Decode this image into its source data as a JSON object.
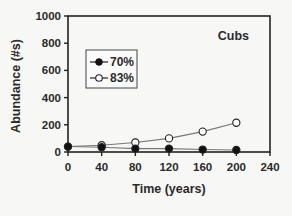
{
  "chart_data": {
    "type": "line",
    "title": "",
    "annotation": "Cubs",
    "xlabel": "Time (years)",
    "ylabel": "Abundance (#s)",
    "xlim": [
      0,
      240
    ],
    "ylim": [
      0,
      1000
    ],
    "xticks": [
      0,
      40,
      80,
      120,
      160,
      200,
      240
    ],
    "yticks": [
      0,
      200,
      400,
      600,
      800,
      1000
    ],
    "grid": false,
    "legend_position": "upper-left inside",
    "x": [
      0,
      40,
      80,
      120,
      160,
      200
    ],
    "series": [
      {
        "name": "70%",
        "marker": "filled-circle",
        "values": [
          40,
          35,
          25,
          25,
          18,
          15
        ]
      },
      {
        "name": "83%",
        "marker": "open-circle",
        "values": [
          40,
          50,
          70,
          100,
          150,
          215
        ]
      }
    ]
  },
  "colors": {
    "axis": "#222222",
    "line": "#777777",
    "marker_fill_filled": "#111111",
    "marker_fill_open": "#ffffff",
    "background": "#f7f7f5"
  }
}
